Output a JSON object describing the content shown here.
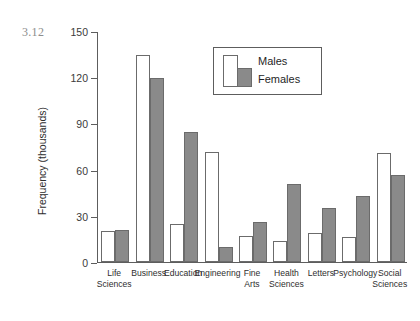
{
  "figure": {
    "number": "3.12"
  },
  "legend": {
    "males_label": "Males",
    "females_label": "Females",
    "males_color": "#ffffff",
    "females_color": "#8a8a8a",
    "border_color": "#5d5d5d",
    "position": "inside-top-center"
  },
  "chart_data": {
    "type": "bar",
    "title": "",
    "xlabel": "",
    "ylabel": "Frequency (thousands)",
    "ylim": [
      0,
      150
    ],
    "yticks": [
      0,
      30,
      60,
      90,
      120,
      150
    ],
    "ytick_labels": [
      "0",
      "30",
      "60",
      "90",
      "120",
      "150"
    ],
    "grid": false,
    "categories": [
      "Life Sciences",
      "Business",
      "Education",
      "Engineering",
      "Fine Arts",
      "Health Sciences",
      "Letters",
      "Psychology",
      "Social Sciences"
    ],
    "category_lines": [
      [
        "Life",
        "Sciences"
      ],
      [
        "Business",
        ""
      ],
      [
        "Education",
        ""
      ],
      [
        "Engineering",
        ""
      ],
      [
        "Fine",
        "Arts"
      ],
      [
        "Health",
        "Sciences"
      ],
      [
        "Letters",
        ""
      ],
      [
        "Psychology",
        ""
      ],
      [
        "Social",
        "Sciences"
      ]
    ],
    "series": [
      {
        "name": "Males",
        "color": "#ffffff",
        "values": [
          20,
          135,
          25,
          72,
          17,
          14,
          19,
          16,
          71
        ]
      },
      {
        "name": "Females",
        "color": "#8a8a8a",
        "values": [
          21,
          120,
          85,
          10,
          26,
          51,
          35,
          43,
          57
        ]
      }
    ]
  }
}
